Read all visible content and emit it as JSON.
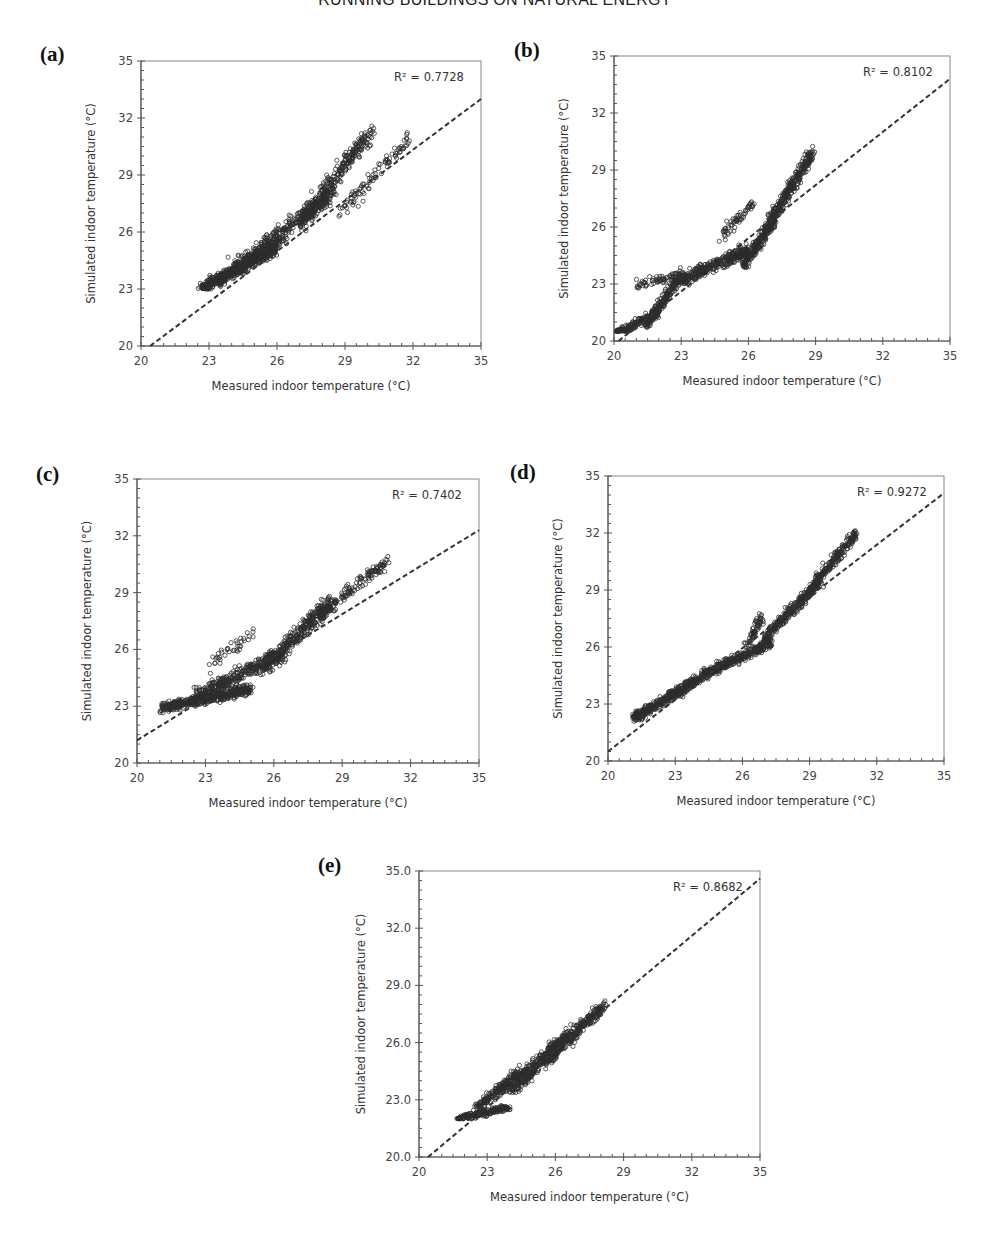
{
  "header": {
    "running_title": "RUNNING BUILDINGS ON NATURAL ENERGY"
  },
  "colors": {
    "marker": "#2b2b2b",
    "axis": "#555555",
    "fit_line": "#333333",
    "background": "#ffffff"
  },
  "chart_data": [
    {
      "id": "a",
      "panel_label": "(a)",
      "type": "scatter",
      "title": "",
      "xlabel": "Measured indoor temperature (°C)",
      "ylabel": "Simulated indoor temperature (°C)",
      "xlim": [
        20,
        35
      ],
      "ylim": [
        20,
        35
      ],
      "xticks": [
        "20",
        "23",
        "26",
        "29",
        "32",
        "35"
      ],
      "yticks": [
        "20",
        "23",
        "26",
        "29",
        "32",
        "35"
      ],
      "grid": false,
      "annotation": "R² = 0.7728",
      "r_squared": 0.7728,
      "fit_line": {
        "style": "dashed",
        "x": [
          20.4,
          35
        ],
        "y": [
          20,
          33.0
        ]
      },
      "layout": {
        "left": 141,
        "top": 61,
        "right": 481,
        "bottom": 346,
        "letter_x": 40,
        "letter_y": 42
      },
      "clusters": [
        {
          "x": [
            22.7,
            26.0
          ],
          "y": [
            23.0,
            25.2
          ],
          "n": 520,
          "spread": 0.5,
          "floor": 23.0
        },
        {
          "x": [
            24.0,
            28.5
          ],
          "y": [
            24.0,
            28.0
          ],
          "n": 420,
          "spread": 0.7
        },
        {
          "x": [
            27.0,
            30.2
          ],
          "y": [
            26.5,
            31.3
          ],
          "n": 280,
          "spread": 0.7
        },
        {
          "x": [
            28.8,
            31.8
          ],
          "y": [
            27.0,
            30.8
          ],
          "n": 90,
          "spread": 0.6
        }
      ]
    },
    {
      "id": "b",
      "panel_label": "(b)",
      "type": "scatter",
      "title": "",
      "xlabel": "Measured indoor temperature (°C)",
      "ylabel": "Simulated indoor temperature (°C)",
      "xlim": [
        20,
        35
      ],
      "ylim": [
        20,
        35
      ],
      "xticks": [
        "20",
        "23",
        "26",
        "29",
        "32",
        "35"
      ],
      "yticks": [
        "20",
        "23",
        "26",
        "29",
        "32",
        "35"
      ],
      "grid": false,
      "annotation": "R² = 0.8102",
      "r_squared": 0.8102,
      "fit_line": {
        "style": "dashed",
        "x": [
          20.2,
          35
        ],
        "y": [
          20,
          33.8
        ]
      },
      "layout": {
        "left": 614,
        "top": 56,
        "right": 950,
        "bottom": 341,
        "letter_x": 514,
        "letter_y": 38
      },
      "clusters": [
        {
          "x": [
            20.1,
            22.0
          ],
          "y": [
            20.4,
            21.5
          ],
          "n": 160,
          "spread": 0.35,
          "floor": 20.5
        },
        {
          "x": [
            21.4,
            23.0
          ],
          "y": [
            20.8,
            23.5
          ],
          "n": 200,
          "spread": 0.45
        },
        {
          "x": [
            21.0,
            22.8
          ],
          "y": [
            23.0,
            23.4
          ],
          "n": 60,
          "spread": 0.35
        },
        {
          "x": [
            23.0,
            26.0
          ],
          "y": [
            23.2,
            24.8
          ],
          "n": 360,
          "spread": 0.5
        },
        {
          "x": [
            24.8,
            26.2
          ],
          "y": [
            25.5,
            27.2
          ],
          "n": 60,
          "spread": 0.5
        },
        {
          "x": [
            25.8,
            27.2
          ],
          "y": [
            24.0,
            26.5
          ],
          "n": 240,
          "spread": 0.5
        },
        {
          "x": [
            26.8,
            28.8
          ],
          "y": [
            26.0,
            29.8
          ],
          "n": 300,
          "spread": 0.55
        }
      ]
    },
    {
      "id": "c",
      "panel_label": "(c)",
      "type": "scatter",
      "title": "",
      "xlabel": "Measured indoor temperature (°C)",
      "ylabel": "Simulated indoor temperature (°C)",
      "xlim": [
        20,
        35
      ],
      "ylim": [
        20,
        35
      ],
      "xticks": [
        "20",
        "23",
        "26",
        "29",
        "32",
        "35"
      ],
      "yticks": [
        "20",
        "23",
        "26",
        "29",
        "32",
        "35"
      ],
      "grid": false,
      "annotation": "R² = 0.7402",
      "r_squared": 0.7402,
      "fit_line": {
        "style": "dashed",
        "x": [
          20,
          35
        ],
        "y": [
          21.2,
          32.3
        ]
      },
      "layout": {
        "left": 137,
        "top": 479,
        "right": 479,
        "bottom": 763,
        "letter_x": 36,
        "letter_y": 462
      },
      "clusters": [
        {
          "x": [
            21.1,
            25.0
          ],
          "y": [
            22.9,
            23.9
          ],
          "n": 480,
          "spread": 0.4
        },
        {
          "x": [
            22.5,
            26.5
          ],
          "y": [
            23.5,
            25.8
          ],
          "n": 360,
          "spread": 0.6
        },
        {
          "x": [
            23.0,
            25.2
          ],
          "y": [
            25.0,
            27.0
          ],
          "n": 40,
          "spread": 0.5
        },
        {
          "x": [
            25.5,
            28.5
          ],
          "y": [
            25.0,
            28.5
          ],
          "n": 320,
          "spread": 0.7
        },
        {
          "x": [
            28.0,
            30.9
          ],
          "y": [
            27.8,
            30.6
          ],
          "n": 150,
          "spread": 0.5
        }
      ]
    },
    {
      "id": "d",
      "panel_label": "(d)",
      "type": "scatter",
      "title": "",
      "xlabel": "Measured indoor temperature (°C)",
      "ylabel": "Simulated indoor temperature (°C)",
      "xlim": [
        20,
        35
      ],
      "ylim": [
        20,
        35
      ],
      "xticks": [
        "20",
        "23",
        "26",
        "29",
        "32",
        "35"
      ],
      "yticks": [
        "20",
        "23",
        "26",
        "29",
        "32",
        "35"
      ],
      "grid": false,
      "annotation": "R² = 0.9272",
      "r_squared": 0.9272,
      "fit_line": {
        "style": "dashed",
        "x": [
          20,
          35
        ],
        "y": [
          20.5,
          34.1
        ]
      },
      "layout": {
        "left": 608,
        "top": 476,
        "right": 944,
        "bottom": 761,
        "letter_x": 510,
        "letter_y": 460
      },
      "clusters": [
        {
          "x": [
            21.1,
            25.0
          ],
          "y": [
            22.2,
            25.0
          ],
          "n": 480,
          "spread": 0.4
        },
        {
          "x": [
            25.0,
            27.3
          ],
          "y": [
            25.0,
            26.2
          ],
          "n": 260,
          "spread": 0.4
        },
        {
          "x": [
            26.2,
            26.9
          ],
          "y": [
            26.0,
            27.6
          ],
          "n": 60,
          "spread": 0.45
        },
        {
          "x": [
            27.0,
            29.5
          ],
          "y": [
            26.5,
            29.5
          ],
          "n": 300,
          "spread": 0.45
        },
        {
          "x": [
            29.0,
            31.1
          ],
          "y": [
            29.0,
            32.0
          ],
          "n": 200,
          "spread": 0.45
        }
      ]
    },
    {
      "id": "e",
      "panel_label": "(e)",
      "type": "scatter",
      "title": "",
      "xlabel": "Measured indoor temperature (°C)",
      "ylabel": "Simulated indoor temperature (°C)",
      "xlim": [
        20,
        35
      ],
      "ylim": [
        20,
        35
      ],
      "xticks": [
        "20",
        "23",
        "26",
        "29",
        "32",
        "35"
      ],
      "yticks": [
        "20.0",
        "23.0",
        "26.0",
        "29.0",
        "32.0",
        "35.0"
      ],
      "grid": false,
      "annotation": "R² = 0.8682",
      "r_squared": 0.8682,
      "fit_line": {
        "style": "dashed",
        "x": [
          20.4,
          35
        ],
        "y": [
          20,
          34.6
        ]
      },
      "layout": {
        "left": 419,
        "top": 871,
        "right": 760,
        "bottom": 1157,
        "letter_x": 318,
        "letter_y": 853
      },
      "clusters": [
        {
          "x": [
            21.7,
            24.0
          ],
          "y": [
            22.0,
            22.6
          ],
          "n": 200,
          "spread": 0.25,
          "floor": 22.0
        },
        {
          "x": [
            22.5,
            24.5
          ],
          "y": [
            22.5,
            24.5
          ],
          "n": 200,
          "spread": 0.5
        },
        {
          "x": [
            24.0,
            26.5
          ],
          "y": [
            23.5,
            26.3
          ],
          "n": 380,
          "spread": 0.6
        },
        {
          "x": [
            25.5,
            28.2
          ],
          "y": [
            25.0,
            28.0
          ],
          "n": 300,
          "spread": 0.55
        }
      ]
    }
  ]
}
